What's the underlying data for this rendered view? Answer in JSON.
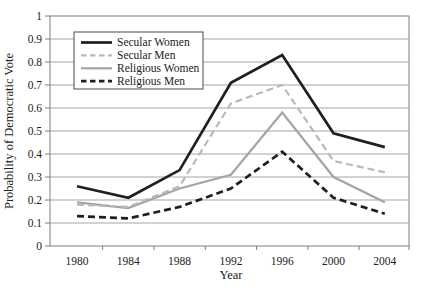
{
  "chart_data": {
    "type": "line",
    "x": [
      1980,
      1984,
      1988,
      1992,
      1996,
      2000,
      2004
    ],
    "series": [
      {
        "name": "Secular Women",
        "values": [
          0.26,
          0.21,
          0.33,
          0.71,
          0.83,
          0.49,
          0.43
        ],
        "color": "#1f1f1f",
        "style": "solid",
        "width": 2.7
      },
      {
        "name": "Secular Men",
        "values": [
          0.18,
          0.17,
          0.26,
          0.62,
          0.7,
          0.37,
          0.32
        ],
        "color": "#b9b9b9",
        "style": "dashed",
        "width": 2.2
      },
      {
        "name": "Religious Women",
        "values": [
          0.19,
          0.165,
          0.25,
          0.31,
          0.58,
          0.3,
          0.19
        ],
        "color": "#a4a4a4",
        "style": "solid",
        "width": 2.2
      },
      {
        "name": "Religious Men",
        "values": [
          0.13,
          0.12,
          0.17,
          0.25,
          0.41,
          0.21,
          0.14
        ],
        "color": "#1f1f1f",
        "style": "dashed",
        "width": 2.7
      }
    ],
    "title": "",
    "xlabel": "Year",
    "ylabel": "Probability of Democratic Vote",
    "ylim": [
      0,
      1
    ],
    "yticks": [
      0,
      0.1,
      0.2,
      0.3,
      0.4,
      0.5,
      0.6,
      0.7,
      0.8,
      0.9,
      1
    ],
    "ytick_labels": [
      "0",
      "0.1",
      "0.2",
      "0.3",
      "0.4",
      "0.5",
      "0.6",
      "0.7",
      "0.8",
      "0.9",
      "1"
    ],
    "grid": true,
    "legend_position": "top-left-inside",
    "colors": {
      "frame": "#7e7e7e",
      "grid": "#9b9b9b",
      "legend_border": "#4a4a4a",
      "text": "#222222"
    }
  }
}
